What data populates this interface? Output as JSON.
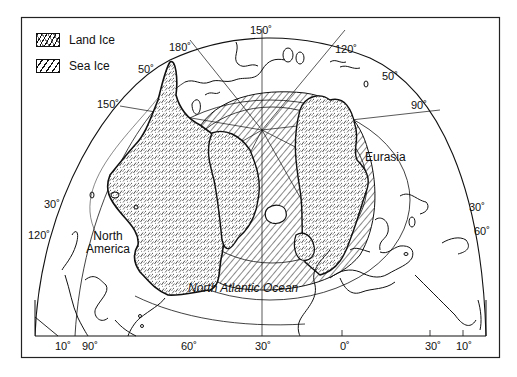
{
  "figure": {
    "colors": {
      "ink": "#111111",
      "background": "#ffffff"
    }
  },
  "legend": {
    "items": [
      {
        "label": "Land Ice",
        "pattern": "stippled-hatch",
        "icon": "land-ice-swatch-icon"
      },
      {
        "label": "Sea Ice",
        "pattern": "diagonal-hatch",
        "icon": "sea-ice-swatch-icon"
      }
    ]
  },
  "regions": {
    "north_america": "North America",
    "north_america_line1": "North",
    "north_america_line2": "America",
    "eurasia": "Eurasia",
    "ocean": "North Atlantic Ocean"
  },
  "graticule_labels": {
    "top_150": "150˚",
    "top_180": "180˚",
    "top_120": "120˚",
    "left_50": "50˚",
    "left_150": "150˚",
    "right_50": "50˚",
    "right_90": "90˚",
    "left_30": "30˚",
    "left_120": "120˚",
    "right_30": "30˚",
    "right_60": "60˚"
  },
  "bottom_axis": {
    "ticks": [
      "10˚",
      "90˚",
      "60˚",
      "30˚",
      "0˚",
      "30˚",
      "10˚"
    ]
  }
}
